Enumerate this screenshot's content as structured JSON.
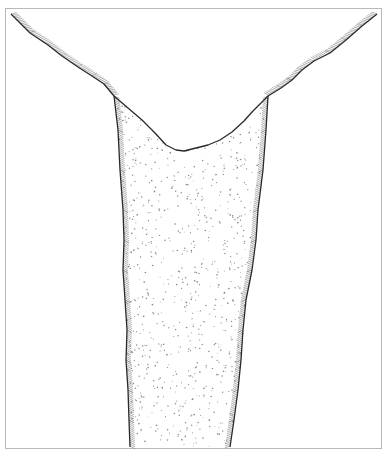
{
  "figure": {
    "frame": {
      "x": 5,
      "y": 8,
      "width": 377,
      "height": 441,
      "stroke": "#b8b8b8"
    },
    "colors": {
      "background": "#ffffff",
      "outline": "#2a2a2a",
      "hatching": "#7a7a7a",
      "stipple": "#8a8a8a"
    },
    "ground_surface": {
      "left": [
        [
          11,
          14
        ],
        [
          30,
          33
        ],
        [
          48,
          45
        ],
        [
          62,
          56
        ],
        [
          78,
          67
        ],
        [
          92,
          76
        ],
        [
          104,
          84
        ],
        [
          114,
          96
        ]
      ],
      "right": [
        [
          377,
          14
        ],
        [
          362,
          26
        ],
        [
          346,
          40
        ],
        [
          330,
          53
        ],
        [
          314,
          61
        ],
        [
          302,
          70
        ],
        [
          292,
          80
        ],
        [
          281,
          88
        ],
        [
          268,
          96
        ]
      ]
    },
    "infill_top_surface": [
      [
        114,
        96
      ],
      [
        128,
        108
      ],
      [
        142,
        120
      ],
      [
        155,
        133
      ],
      [
        166,
        145
      ],
      [
        176,
        150
      ],
      [
        184,
        151
      ],
      [
        196,
        148
      ],
      [
        208,
        145
      ],
      [
        220,
        140
      ],
      [
        232,
        132
      ],
      [
        244,
        121
      ],
      [
        252,
        112
      ],
      [
        260,
        104
      ],
      [
        268,
        96
      ]
    ],
    "left_wall": [
      [
        114,
        96
      ],
      [
        118,
        130
      ],
      [
        120,
        170
      ],
      [
        123,
        210
      ],
      [
        124,
        240
      ],
      [
        123,
        270
      ],
      [
        125,
        300
      ],
      [
        127,
        330
      ],
      [
        126,
        360
      ],
      [
        128,
        390
      ],
      [
        129,
        420
      ],
      [
        130,
        447
      ]
    ],
    "right_wall": [
      [
        268,
        96
      ],
      [
        266,
        130
      ],
      [
        263,
        170
      ],
      [
        258,
        210
      ],
      [
        256,
        240
      ],
      [
        252,
        270
      ],
      [
        246,
        300
      ],
      [
        243,
        330
      ],
      [
        241,
        360
      ],
      [
        238,
        390
      ],
      [
        234,
        420
      ],
      [
        230,
        447
      ]
    ]
  }
}
